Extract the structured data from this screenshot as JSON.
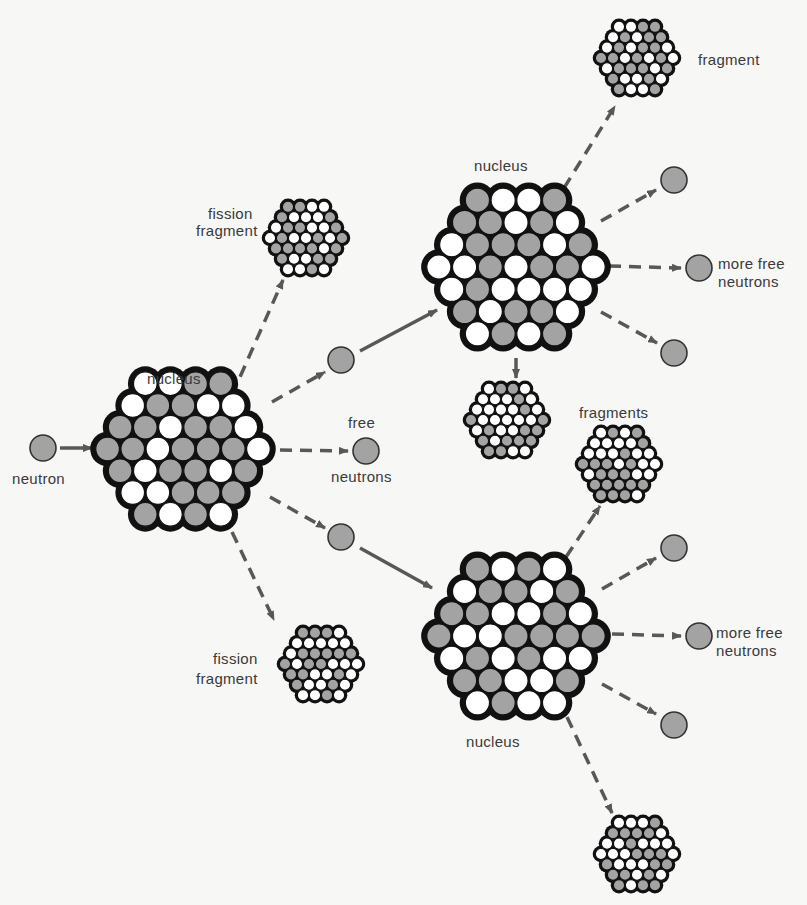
{
  "colors": {
    "background": "#f7f7f5",
    "gray_nucleon": "#a3a3a3",
    "white_nucleon": "#ffffff",
    "nucleus_body": "#111111",
    "arrow": "#585858",
    "text": "#3a3a3a"
  },
  "labels": {
    "neutron": "neutron",
    "nucleus_left": "nucleus",
    "free_neutrons_line1": "free",
    "free_neutrons_line2": "neutrons",
    "fission_fragment_top_line1": "fission",
    "fission_fragment_top_line2": "fragment",
    "fission_fragment_bottom_line1": "fission",
    "fission_fragment_bottom_line2": "fragment",
    "nucleus_upper_right": "nucleus",
    "fragment_top_right": "fragment",
    "more_free_neutrons_upper_line1": "more free",
    "more_free_neutrons_upper_line2": "neutrons",
    "fragments_middle": "fragments",
    "more_free_neutrons_lower_line1": "more free",
    "more_free_neutrons_lower_line2": "neutrons",
    "nucleus_lower_right": "nucleus"
  },
  "nodes": {
    "big_nuclei": [
      {
        "id": "nucleus-1",
        "cx": 183,
        "cy": 449,
        "r": 88
      },
      {
        "id": "nucleus-2",
        "cx": 516,
        "cy": 267,
        "r": 90
      },
      {
        "id": "nucleus-3",
        "cx": 516,
        "cy": 636,
        "r": 90
      }
    ],
    "fragments": [
      {
        "id": "fragment-1",
        "cx": 306,
        "cy": 238,
        "r": 42
      },
      {
        "id": "fragment-2",
        "cx": 321,
        "cy": 664,
        "r": 42
      },
      {
        "id": "fragment-3",
        "cx": 637,
        "cy": 58,
        "r": 42
      },
      {
        "id": "fragment-4",
        "cx": 507,
        "cy": 420,
        "r": 42
      },
      {
        "id": "fragment-5",
        "cx": 619,
        "cy": 464,
        "r": 42
      },
      {
        "id": "fragment-6",
        "cx": 637,
        "cy": 854,
        "r": 42
      }
    ],
    "neutrons": [
      {
        "id": "neutron-initial",
        "cx": 43,
        "cy": 448
      },
      {
        "id": "neutron-upper",
        "cx": 341,
        "cy": 360
      },
      {
        "id": "neutron-free",
        "cx": 366,
        "cy": 451
      },
      {
        "id": "neutron-lower",
        "cx": 341,
        "cy": 537
      },
      {
        "id": "neutron-ur-1",
        "cx": 674,
        "cy": 180
      },
      {
        "id": "neutron-ur-2",
        "cx": 699,
        "cy": 268
      },
      {
        "id": "neutron-ur-3",
        "cx": 674,
        "cy": 353
      },
      {
        "id": "neutron-lr-1",
        "cx": 674,
        "cy": 548
      },
      {
        "id": "neutron-lr-2",
        "cx": 699,
        "cy": 636
      },
      {
        "id": "neutron-lr-3",
        "cx": 674,
        "cy": 725
      }
    ]
  },
  "arrows": [
    {
      "from": "neutron-initial",
      "to": "nucleus-1",
      "style": "solid",
      "x1": 60,
      "y1": 448,
      "x2": 92,
      "y2": 448
    },
    {
      "from": "nucleus-1",
      "to": "fragment-1",
      "style": "dashed",
      "x1": 232,
      "y1": 395,
      "x2": 283,
      "y2": 280
    },
    {
      "from": "nucleus-1",
      "to": "neutron-upper",
      "style": "dashed",
      "x1": 272,
      "y1": 402,
      "x2": 325,
      "y2": 372
    },
    {
      "from": "nucleus-1",
      "to": "neutron-free",
      "style": "dashed",
      "x1": 280,
      "y1": 450,
      "x2": 348,
      "y2": 451
    },
    {
      "from": "nucleus-1",
      "to": "neutron-lower",
      "style": "dashed",
      "x1": 270,
      "y1": 497,
      "x2": 325,
      "y2": 528
    },
    {
      "from": "nucleus-1",
      "to": "fragment-2",
      "style": "dashed",
      "x1": 232,
      "y1": 532,
      "x2": 274,
      "y2": 620
    },
    {
      "from": "neutron-upper",
      "to": "nucleus-2",
      "style": "solid",
      "x1": 360,
      "y1": 351,
      "x2": 437,
      "y2": 310
    },
    {
      "from": "neutron-lower",
      "to": "nucleus-3",
      "style": "solid",
      "x1": 360,
      "y1": 548,
      "x2": 432,
      "y2": 588
    },
    {
      "from": "nucleus-2",
      "to": "fragment-3",
      "style": "dashed",
      "x1": 564,
      "y1": 188,
      "x2": 615,
      "y2": 106
    },
    {
      "from": "nucleus-2",
      "to": "neutron-ur-1",
      "style": "dashed",
      "x1": 601,
      "y1": 221,
      "x2": 656,
      "y2": 190
    },
    {
      "from": "nucleus-2",
      "to": "neutron-ur-2",
      "style": "dashed",
      "x1": 609,
      "y1": 266,
      "x2": 681,
      "y2": 268
    },
    {
      "from": "nucleus-2",
      "to": "neutron-ur-3",
      "style": "dashed",
      "x1": 601,
      "y1": 312,
      "x2": 657,
      "y2": 343
    },
    {
      "from": "nucleus-2",
      "to": "fragment-4",
      "style": "solid",
      "x1": 516,
      "y1": 358,
      "x2": 516,
      "y2": 378
    },
    {
      "from": "nucleus-3",
      "to": "fragment-5",
      "style": "dashed",
      "x1": 566,
      "y1": 557,
      "x2": 600,
      "y2": 506
    },
    {
      "from": "nucleus-3",
      "to": "neutron-lr-1",
      "style": "dashed",
      "x1": 602,
      "y1": 589,
      "x2": 656,
      "y2": 558
    },
    {
      "from": "nucleus-3",
      "to": "neutron-lr-2",
      "style": "dashed",
      "x1": 612,
      "y1": 634,
      "x2": 681,
      "y2": 636
    },
    {
      "from": "nucleus-3",
      "to": "neutron-lr-3",
      "style": "dashed",
      "x1": 602,
      "y1": 684,
      "x2": 656,
      "y2": 714
    },
    {
      "from": "nucleus-3",
      "to": "fragment-6",
      "style": "dashed",
      "x1": 567,
      "y1": 717,
      "x2": 612,
      "y2": 813
    }
  ]
}
